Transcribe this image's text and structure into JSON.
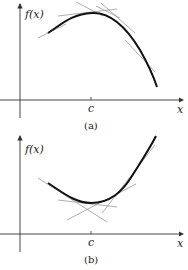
{
  "panels": [
    {
      "id": "a",
      "caption": "(a)",
      "y_label": "f(x)",
      "x_label": "x",
      "tick_label": "c",
      "curve": "concave down, maximum at c",
      "tangent_lines": 4
    },
    {
      "id": "b",
      "caption": "(b)",
      "y_label": "f(x)",
      "x_label": "x",
      "tick_label": "c",
      "curve": "concave up, minimum at c",
      "tangent_lines": 4
    }
  ],
  "colors": {
    "curve": "#111111",
    "tangent": "#8a8a8a",
    "axis": "#333333"
  }
}
